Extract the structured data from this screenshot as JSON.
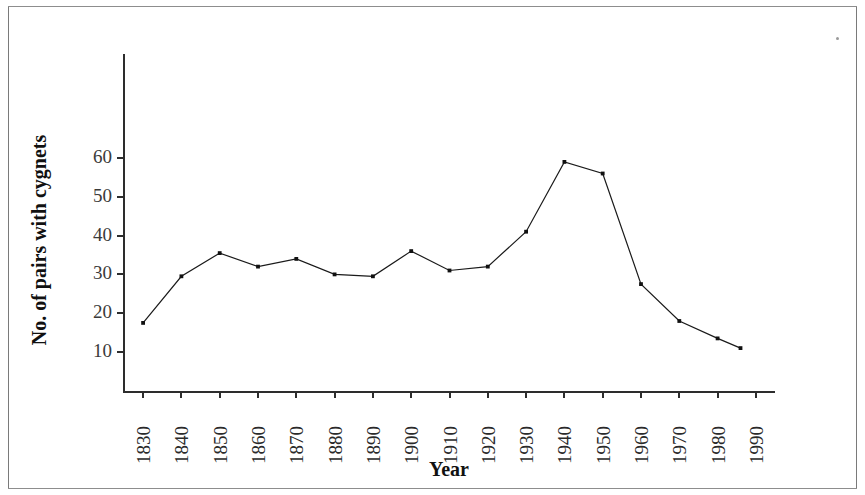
{
  "figure": {
    "background_color": "#ffffff",
    "line_color": "#1a1a1a",
    "marker_color": "#111111",
    "axis_color": "#2d2d2d",
    "frame_color": "#7a7a7a"
  },
  "chart_data": {
    "type": "line",
    "title": "",
    "xlabel": "Year",
    "ylabel": "No. of pairs with cygnets",
    "xlim": [
      1825,
      1995
    ],
    "ylim": [
      0,
      68
    ],
    "grid": false,
    "legend": null,
    "xticks": [
      1830,
      1840,
      1850,
      1860,
      1870,
      1880,
      1890,
      1900,
      1910,
      1920,
      1930,
      1940,
      1950,
      1960,
      1970,
      1980,
      1990
    ],
    "xtick_labels": [
      "1830",
      "1840",
      "1850",
      "1860",
      "1870",
      "1880",
      "1890",
      "1900",
      "1910",
      "1920",
      "1930",
      "1940",
      "1950",
      "1960",
      "1970",
      "1980",
      "1990"
    ],
    "yticks": [
      10,
      20,
      30,
      40,
      50,
      60
    ],
    "ytick_labels": [
      "10",
      "20",
      "30",
      "40",
      "50",
      "60"
    ],
    "x": [
      1830,
      1840,
      1850,
      1860,
      1870,
      1880,
      1890,
      1900,
      1910,
      1920,
      1930,
      1940,
      1950,
      1960,
      1970,
      1980,
      1986
    ],
    "values": [
      17.5,
      29.5,
      35.5,
      32,
      34,
      30,
      29.5,
      36,
      31,
      32,
      41,
      59,
      56,
      27.5,
      18,
      13.5,
      11
    ],
    "marker": "point",
    "series_name": "No. of pairs with cygnets"
  }
}
